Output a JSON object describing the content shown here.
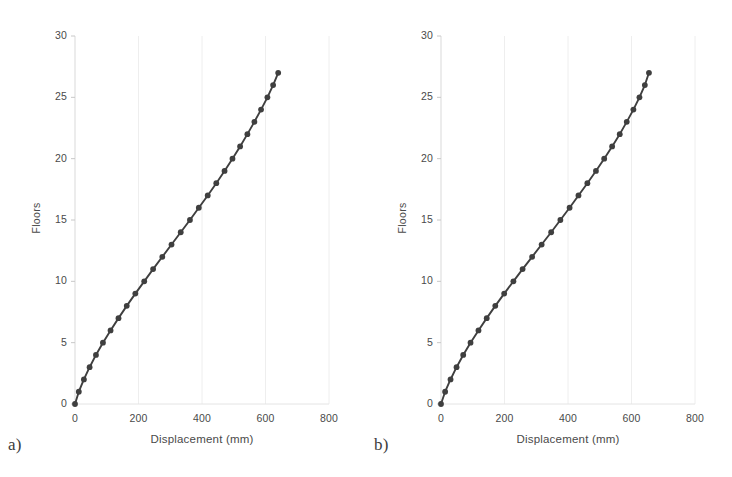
{
  "figure": {
    "panels": [
      {
        "tag": "a)",
        "chart_data": {
          "type": "line",
          "title": "",
          "xlabel": "Displacement (mm)",
          "ylabel": "Floors",
          "xlim": [
            0,
            800
          ],
          "ylim": [
            0,
            30
          ],
          "xticks": [
            0,
            200,
            400,
            600,
            800
          ],
          "yticks": [
            0,
            5,
            10,
            15,
            20,
            25,
            30
          ],
          "grid": "vertical-faint",
          "legend": "none",
          "marker": "circle",
          "line_color": "#3f3f3f",
          "marker_color": "#3f3f3f",
          "series": [
            {
              "name": "Displacement profile a",
              "x": [
                0,
                12,
                28,
                46,
                66,
                88,
                112,
                137,
                163,
                190,
                218,
                246,
                275,
                304,
                333,
                362,
                390,
                418,
                445,
                471,
                496,
                520,
                543,
                565,
                586,
                606,
                624,
                640
              ],
              "y": [
                0,
                1,
                2,
                3,
                4,
                5,
                6,
                7,
                8,
                9,
                10,
                11,
                12,
                13,
                14,
                15,
                16,
                17,
                18,
                19,
                20,
                21,
                22,
                23,
                24,
                25,
                26,
                27
              ]
            }
          ]
        }
      },
      {
        "tag": "b)",
        "chart_data": {
          "type": "line",
          "title": "",
          "xlabel": "Displacement (mm)",
          "ylabel": "Floors",
          "xlim": [
            0,
            800
          ],
          "ylim": [
            0,
            30
          ],
          "xticks": [
            0,
            200,
            400,
            600,
            800
          ],
          "yticks": [
            0,
            5,
            10,
            15,
            20,
            25,
            30
          ],
          "grid": "vertical-faint",
          "legend": "none",
          "marker": "circle",
          "line_color": "#3f3f3f",
          "marker_color": "#3f3f3f",
          "series": [
            {
              "name": "Displacement profile b",
              "x": [
                0,
                13,
                30,
                49,
                70,
                93,
                118,
                144,
                171,
                199,
                228,
                257,
                287,
                317,
                347,
                376,
                405,
                433,
                461,
                488,
                514,
                539,
                563,
                585,
                606,
                625,
                642,
                655
              ],
              "y": [
                0,
                1,
                2,
                3,
                4,
                5,
                6,
                7,
                8,
                9,
                10,
                11,
                12,
                13,
                14,
                15,
                16,
                17,
                18,
                19,
                20,
                21,
                22,
                23,
                24,
                25,
                26,
                27
              ]
            }
          ]
        }
      }
    ]
  }
}
